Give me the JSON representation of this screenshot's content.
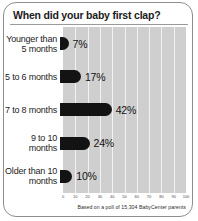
{
  "card": {
    "title": "When did your baby first clap?",
    "footnote": "Based on a poll of 15,304 BabyCenter parents"
  },
  "chart_data": {
    "type": "bar",
    "orientation": "horizontal",
    "title": "When did your baby first clap?",
    "xlabel": "",
    "ylabel": "",
    "xlim": [
      0,
      100
    ],
    "grid": true,
    "legend": "none",
    "categories": [
      "Younger than 5 months",
      "5 to 6 months",
      "7 to 8 months",
      "9 to 10 months",
      "Older than 10 months"
    ],
    "values": [
      7,
      17,
      42,
      24,
      10
    ],
    "data_labels": [
      "7%",
      "17%",
      "42%",
      "24%",
      "10%"
    ],
    "xticks": [
      0,
      10,
      20,
      30,
      40,
      50,
      60,
      70,
      80,
      90,
      100
    ],
    "xtick_labels": [
      "0",
      "10",
      "20",
      "30",
      "40",
      "50",
      "60",
      "70",
      "80",
      "90",
      "100"
    ],
    "annotation": "Based on a poll of 15,304 BabyCenter parents",
    "colors": {
      "bar": "#131313",
      "plot_background": "#cfcfcf",
      "gridline": "#f2f2f2",
      "text": "#1d1d1d"
    }
  }
}
